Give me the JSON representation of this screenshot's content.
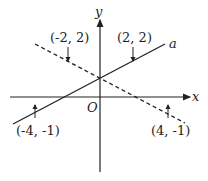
{
  "diagram": {
    "axes": {
      "x_label": "x",
      "y_label": "y",
      "origin_label": "O"
    },
    "lines": [
      {
        "name": "a",
        "style": "solid",
        "label": "a",
        "points": [
          "(-4, -1)",
          "(2, 2)"
        ]
      },
      {
        "name": "dashed",
        "style": "dashed",
        "points": [
          "(-2, 2)",
          "(4, -1)"
        ]
      }
    ],
    "point_labels": {
      "p1": "(-2, 2)",
      "p2": "(2, 2)",
      "p3": "(-4, -1)",
      "p4": "(4, -1)"
    },
    "colors": {
      "stroke": "#222222",
      "background": "#ffffff"
    }
  }
}
